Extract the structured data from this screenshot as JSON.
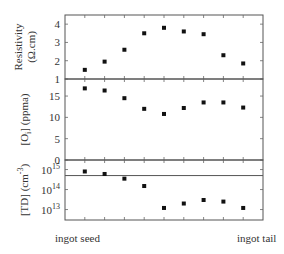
{
  "chart_data": [
    {
      "type": "scatter",
      "panel": "top",
      "ylabel": [
        "Resistivity",
        "(Ω.cm)"
      ],
      "ylim": [
        1,
        4.5
      ],
      "yticks": [
        1,
        2,
        3,
        4
      ],
      "ytick_labels": [
        "1",
        "2",
        "3",
        "4"
      ],
      "x": [
        1,
        2,
        3,
        4,
        5,
        6,
        7,
        8,
        9
      ],
      "values": [
        1.5,
        1.95,
        2.6,
        3.5,
        3.8,
        3.6,
        3.45,
        2.3,
        1.85
      ]
    },
    {
      "type": "scatter",
      "panel": "middle",
      "ylabel": [
        "[O",
        "i",
        "] (ppma)"
      ],
      "ylim": [
        0,
        19
      ],
      "yticks": [
        0,
        5,
        10,
        15
      ],
      "ytick_labels": [
        "0",
        "5",
        "10",
        "15"
      ],
      "x": [
        1,
        2,
        3,
        4,
        5,
        6,
        7,
        8,
        9
      ],
      "values": [
        16.8,
        16.3,
        14.5,
        12.0,
        10.8,
        12.2,
        13.5,
        13.5,
        12.3
      ]
    },
    {
      "type": "scatter",
      "panel": "bottom",
      "ylabel": [
        "[TD] (cm",
        "-3",
        ")"
      ],
      "yscale": "log",
      "ylim": [
        3000000000000.0,
        3000000000000000.0
      ],
      "yticks": [
        10000000000000.0,
        100000000000000.0,
        1000000000000000.0
      ],
      "ytick_labels": [
        [
          "10",
          "13"
        ],
        [
          "10",
          "14"
        ],
        [
          "10",
          "15"
        ]
      ],
      "reference_line": 500000000000000.0,
      "x": [
        1,
        2,
        3,
        4,
        5,
        6,
        7,
        8,
        9
      ],
      "values": [
        800000000000000.0,
        600000000000000.0,
        350000000000000.0,
        150000000000000.0,
        12000000000000.0,
        20000000000000.0,
        30000000000000.0,
        25000000000000.0,
        12000000000000.0
      ]
    }
  ],
  "xaxis": {
    "xlim": [
      0,
      10
    ],
    "left_label": "ingot seed",
    "right_label": "ingot tail"
  }
}
